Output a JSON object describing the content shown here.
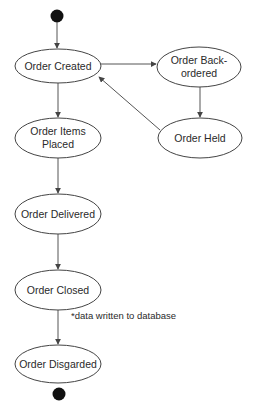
{
  "diagram": {
    "type": "UML state diagram",
    "colors": {
      "line": "#555555",
      "ellipse_stroke": "#444444",
      "text": "#2a2a2a",
      "terminal": "#111111",
      "background": "#ffffff"
    },
    "start_node": {
      "cx": 57,
      "cy": 16,
      "r": 6
    },
    "end_node": {
      "cx": 59,
      "cy": 394,
      "r": 6
    },
    "nodes": [
      {
        "id": "created",
        "lines": [
          "Order Created"
        ],
        "cx": 58,
        "cy": 66,
        "rx": 43,
        "ry": 17
      },
      {
        "id": "backordered",
        "lines": [
          "Order Back-",
          "ordered"
        ],
        "cx": 199,
        "cy": 67,
        "rx": 42,
        "ry": 20
      },
      {
        "id": "held",
        "lines": [
          "Order Held"
        ],
        "cx": 200,
        "cy": 138,
        "rx": 42,
        "ry": 20
      },
      {
        "id": "items_placed",
        "lines": [
          "Order Items",
          "Placed"
        ],
        "cx": 58,
        "cy": 138,
        "rx": 43,
        "ry": 20
      },
      {
        "id": "delivered",
        "lines": [
          "Order Delivered"
        ],
        "cx": 58,
        "cy": 214,
        "rx": 43,
        "ry": 20
      },
      {
        "id": "closed",
        "lines": [
          "Order Closed"
        ],
        "cx": 58,
        "cy": 290,
        "rx": 43,
        "ry": 20
      },
      {
        "id": "disgarded",
        "lines": [
          "Order Disgarded"
        ],
        "cx": 58,
        "cy": 364,
        "rx": 43,
        "ry": 19
      }
    ],
    "edges": [
      {
        "from": "start",
        "to": "created"
      },
      {
        "from": "created",
        "to": "backordered"
      },
      {
        "from": "backordered",
        "to": "held"
      },
      {
        "from": "held",
        "to": "created"
      },
      {
        "from": "created",
        "to": "items_placed"
      },
      {
        "from": "items_placed",
        "to": "delivered"
      },
      {
        "from": "delivered",
        "to": "closed"
      },
      {
        "from": "closed",
        "to": "disgarded",
        "annotation": "*data written to database"
      },
      {
        "from": "disgarded",
        "to": "end"
      }
    ],
    "labels": {
      "created": "Order Created",
      "backordered_1": "Order Back-",
      "backordered_2": "ordered",
      "held": "Order Held",
      "items_placed_1": "Order Items",
      "items_placed_2": "Placed",
      "delivered": "Order Delivered",
      "closed": "Order Closed",
      "disgarded": "Order Disgarded",
      "note": "*data written to database"
    }
  }
}
